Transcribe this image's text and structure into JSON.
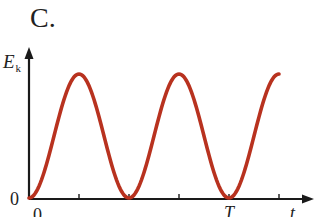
{
  "panel_label": "C.",
  "axes": {
    "y_label_main": "E",
    "y_label_sub": "k",
    "x_label": "t",
    "origin_y_label": "0",
    "origin_x_label": "0",
    "x_tick_label": "T"
  },
  "colors": {
    "curve": "#b8321f",
    "axis": "#1a1a1a"
  },
  "chart_data": {
    "type": "line",
    "title": "C.",
    "xlabel": "t",
    "ylabel": "E_k",
    "x_ticks": [
      "0",
      "T/4",
      "T/2",
      "3T/4",
      "T",
      "5T/4"
    ],
    "x_tick_labels_shown": {
      "0": "0",
      "T": "T"
    },
    "x": [
      0,
      0.125,
      0.25,
      0.375,
      0.5,
      0.625,
      0.75,
      0.875,
      1.0,
      1.125,
      1.25
    ],
    "x_units": "T",
    "series": [
      {
        "name": "E_k",
        "values": [
          0,
          0.5,
          1,
          0.5,
          0,
          0.5,
          1,
          0.5,
          0,
          0.5,
          1
        ]
      }
    ],
    "ylim": [
      0,
      1.3
    ],
    "xlim": [
      0,
      1.4
    ],
    "grid": false,
    "legend": "none"
  }
}
